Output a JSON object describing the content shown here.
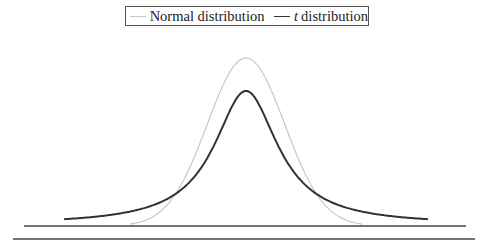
{
  "chart_data": {
    "type": "line",
    "title": "",
    "xlabel": "",
    "ylabel": "",
    "grid": false,
    "legend_position": "top-center",
    "legend": [
      {
        "name": "Normal distribution",
        "color": "#c8c8c8",
        "style": "thin light gray"
      },
      {
        "name": "t distribution",
        "italic_prefix": "t",
        "suffix": " distribution",
        "color": "#333333",
        "style": "thick dark"
      }
    ],
    "series": [
      {
        "name": "Normal distribution",
        "distribution": "standard normal",
        "peak_density": 0.399,
        "x_range": [
          -3,
          3
        ]
      },
      {
        "name": "t distribution",
        "distribution": "Student t (heavy tails, ~1 df)",
        "peak_density": 0.318,
        "x_range": [
          -4.7,
          4.7
        ]
      }
    ],
    "xlim": [
      -4.7,
      4.7
    ],
    "ylim": [
      0,
      0.42
    ],
    "ticks": "none"
  },
  "legend": {
    "normal_label": "Normal distribution",
    "t_italic": "t",
    "t_rest": " distribution"
  }
}
